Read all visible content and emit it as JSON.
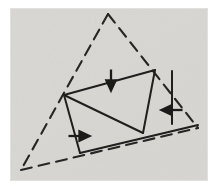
{
  "figure": {
    "canvas": {
      "width": 218,
      "height": 189
    },
    "colors": {
      "page_background": "#ffffff",
      "panel_background": "#d8d7d3",
      "panel_background_light": "#e2e1dd",
      "ink": "#232323",
      "ink_soft": "#3a3a38"
    },
    "panel": {
      "x": 10,
      "y": 8,
      "width": 198,
      "height": 173
    },
    "outer_triangle": {
      "name": "dashed-outer-triangle",
      "style": "dashed",
      "vertices": [
        {
          "label": "apex",
          "x": 108,
          "y": 14
        },
        {
          "label": "bottom-left",
          "x": 21,
          "y": 170
        },
        {
          "label": "bottom-right",
          "x": 198,
          "y": 128
        }
      ]
    },
    "inner_shape": {
      "name": "solid-inner-quadrilateral",
      "style": "solid",
      "vertices": [
        {
          "label": "left",
          "x": 64,
          "y": 95
        },
        {
          "label": "top-right",
          "x": 155,
          "y": 70
        },
        {
          "label": "bottom-mid",
          "x": 143,
          "y": 133
        },
        {
          "label": "base-left",
          "x": 80,
          "y": 153
        }
      ]
    },
    "segments": [
      {
        "name": "top-edge",
        "x1": 64,
        "y1": 95,
        "x2": 155,
        "y2": 70,
        "style": "solid"
      },
      {
        "name": "diagonal-edge",
        "x1": 64,
        "y1": 95,
        "x2": 143,
        "y2": 133,
        "style": "solid"
      },
      {
        "name": "right-slant-edge",
        "x1": 155,
        "y1": 70,
        "x2": 143,
        "y2": 133,
        "style": "solid"
      },
      {
        "name": "left-drop-edge",
        "x1": 64,
        "y1": 95,
        "x2": 80,
        "y2": 153,
        "style": "solid"
      },
      {
        "name": "base-edge",
        "x1": 80,
        "y1": 153,
        "x2": 198,
        "y2": 125,
        "style": "solid"
      },
      {
        "name": "right-drop-edge",
        "x1": 172,
        "y1": 71,
        "x2": 172,
        "y2": 124,
        "style": "solid"
      }
    ],
    "arrow_marks": [
      {
        "name": "arrow-mark-down",
        "direction": "down",
        "x": 111,
        "y": 78,
        "length": 17
      },
      {
        "name": "arrow-mark-right",
        "direction": "right",
        "x": 77,
        "y": 136,
        "length": 17
      },
      {
        "name": "arrow-mark-left",
        "direction": "left",
        "x": 172,
        "y": 110,
        "length": 17
      }
    ]
  }
}
